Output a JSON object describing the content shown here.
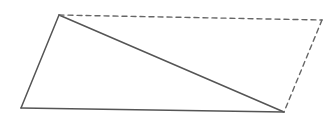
{
  "diagram": {
    "title": "",
    "width": 333,
    "height": 120,
    "background": "#ffffff",
    "stroke_color": "#555555",
    "dashed_color": "#666666",
    "vertices": {
      "A": {
        "x": 59,
        "y": 15
      },
      "B": {
        "x": 21,
        "y": 108
      },
      "C": {
        "x": 284,
        "y": 112
      },
      "D": {
        "x": 322,
        "y": 20
      }
    },
    "edges": [
      {
        "from": "A",
        "to": "B",
        "style": "solid"
      },
      {
        "from": "B",
        "to": "C",
        "style": "solid"
      },
      {
        "from": "A",
        "to": "C",
        "style": "solid"
      },
      {
        "from": "A",
        "to": "D",
        "style": "dashed"
      },
      {
        "from": "D",
        "to": "C",
        "style": "dashed"
      }
    ]
  }
}
